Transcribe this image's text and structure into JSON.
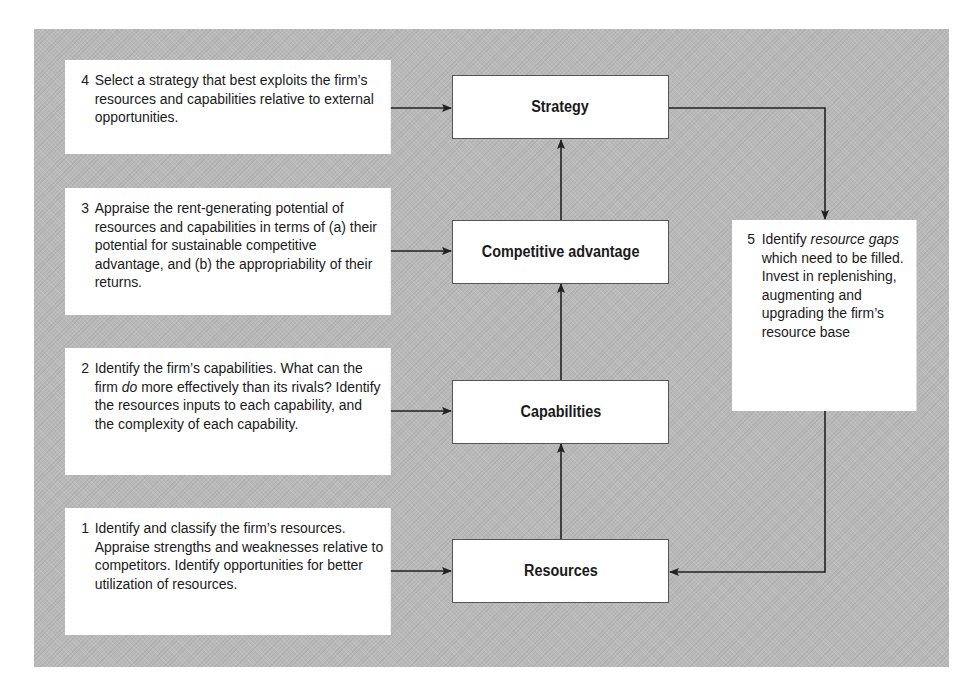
{
  "diagram": {
    "nodes": [
      {
        "id": "strategy",
        "label": "Strategy"
      },
      {
        "id": "competitive_advantage",
        "label": "Competitive advantage"
      },
      {
        "id": "capabilities",
        "label": "Capabilities"
      },
      {
        "id": "resources",
        "label": "Resources"
      }
    ],
    "steps": [
      {
        "number": "1",
        "text": "Identify and classify the firm’s resources. Appraise strengths and weaknesses relative to competitors. Identify opportunities for better utilization of resources.",
        "target": "resources"
      },
      {
        "number": "2",
        "text_before": "Identify the firm’s capabilities. What can the firm ",
        "text_italic": "do",
        "text_after": " more effectively than its rivals? Identify the resources inputs to each capability, and the complexity of each capability.",
        "target": "capabilities"
      },
      {
        "number": "3",
        "text": "Appraise the rent-generating potential of resources and capabilities in terms of (a) their potential for sustainable competitive advantage, and (b) the appropriability of their returns.",
        "target": "competitive_advantage"
      },
      {
        "number": "4",
        "text": "Select a strategy that best exploits the firm’s resources and capabilities relative to external opportunities.",
        "target": "strategy"
      },
      {
        "number": "5",
        "text_before": "Identify ",
        "text_italic": "resource gaps",
        "text_after": " which need to be filled. Invest in replenishing, augmenting and upgrading the firm’s resource base",
        "from": "strategy",
        "target": "resources"
      }
    ],
    "edges": [
      {
        "from": "resources",
        "to": "capabilities"
      },
      {
        "from": "capabilities",
        "to": "competitive_advantage"
      },
      {
        "from": "competitive_advantage",
        "to": "strategy"
      },
      {
        "from": "strategy",
        "to": "step_5"
      },
      {
        "from": "step_5",
        "to": "resources"
      }
    ],
    "colors": {
      "background": "#b9b9b9",
      "box": "#ffffff",
      "line": "#222222"
    }
  }
}
